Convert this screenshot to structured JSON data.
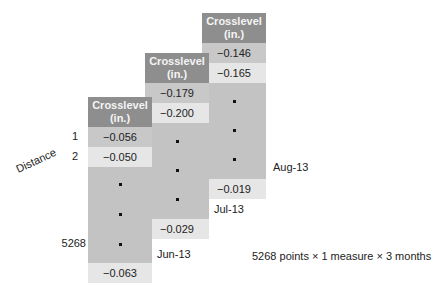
{
  "figure": {
    "axis_label": "Distance",
    "row_labels": [
      "1",
      "2",
      "5268"
    ],
    "caption": "5268 points × 1 measure × 3 months",
    "months": [
      {
        "label": "Jun-13",
        "header_line1": "Crosslevel",
        "header_line2": "(in.)",
        "first": "−0.056",
        "second": "−0.050",
        "last": "−0.063"
      },
      {
        "label": "Jul-13",
        "header_line1": "Crosslevel",
        "header_line2": "(in.)",
        "first": "−0.179",
        "second": "−0.200",
        "last": "−0.029"
      },
      {
        "label": "Aug-13",
        "header_line1": "Crosslevel",
        "header_line2": "(in.)",
        "first": "−0.146",
        "second": "−0.165",
        "last": "−0.019"
      }
    ],
    "colors": {
      "header_bg": "#8e8e8e",
      "cell_dark": "#c8c8c8",
      "cell_light": "#e6e6e6",
      "ellipsis_bg": "#c3c3c3"
    }
  }
}
